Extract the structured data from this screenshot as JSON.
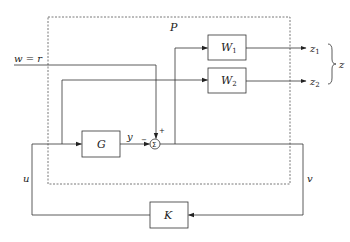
{
  "diagram": {
    "type": "block-diagram",
    "plant_label": "P",
    "blocks": {
      "W1": {
        "name": "W",
        "sub": "1"
      },
      "W2": {
        "name": "W",
        "sub": "2"
      },
      "G": {
        "name": "G"
      },
      "K": {
        "name": "K"
      }
    },
    "summing_junction": {
      "symbol": "Σ",
      "plus": "+",
      "minus": "−"
    },
    "signals": {
      "w": "w = r",
      "y": "y",
      "u": "u",
      "v": "v",
      "z1": {
        "name": "z",
        "sub": "1"
      },
      "z2": {
        "name": "z",
        "sub": "2"
      },
      "z": "z"
    }
  }
}
